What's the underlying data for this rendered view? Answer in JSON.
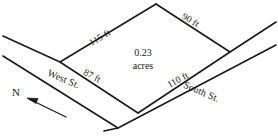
{
  "figure": {
    "name": "land-parcel-survey-diagram",
    "background_color": "#ffffff",
    "line_color": "#1a1a1a",
    "parcel": {
      "area_value": "0.23",
      "area_unit": "acres",
      "sides": [
        {
          "id": "northwest",
          "label": "115 ft"
        },
        {
          "id": "northeast",
          "label": "90 ft"
        },
        {
          "id": "southwest",
          "label": "87 ft"
        },
        {
          "id": "southeast",
          "label": "110 ft"
        }
      ]
    },
    "streets": [
      {
        "id": "west-street",
        "label": "West St."
      },
      {
        "id": "south-street",
        "label": "South St."
      }
    ],
    "compass": {
      "label": "N"
    }
  }
}
